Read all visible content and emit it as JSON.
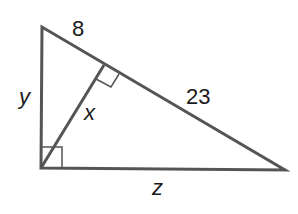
{
  "diagram": {
    "type": "right-triangle-with-altitude",
    "vertices": {
      "top": [
        42,
        27
      ],
      "right_angle": [
        41,
        168
      ],
      "right": [
        285,
        170
      ],
      "altitude_foot": [
        104,
        65
      ]
    },
    "labels": {
      "top_segment": "8",
      "bottom_segment": "23",
      "left_leg": "y",
      "altitude": "x",
      "bottom_leg": "z"
    },
    "colors": {
      "stroke": "#555555",
      "text": "#1a1a1a"
    }
  }
}
